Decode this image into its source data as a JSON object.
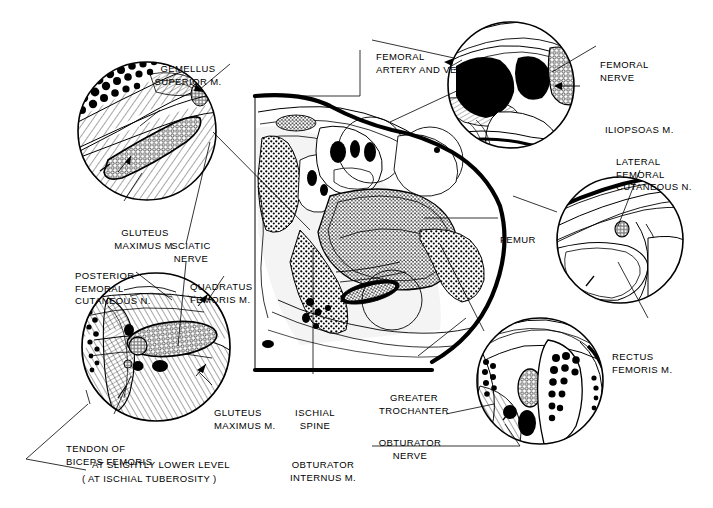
{
  "figure": {
    "domain_type": "anatomical-cross-section-illustration",
    "title_visible": false,
    "background_color": "#ffffff",
    "ink_color": "#000000",
    "caption": {
      "line1": "AT SLIGHTLY LOWER LEVEL",
      "line2": "( AT ISCHIAL TUBEROSITY )"
    }
  },
  "labels": [
    {
      "id": "gemellus-superior",
      "text": "GEMELLUS\nSUPERIOR M.",
      "x": 188,
      "y": 38,
      "align": "center"
    },
    {
      "id": "gluteus-maximus-upper",
      "text": "GLUTEUS\nMAXIMUS M.",
      "x": 100,
      "y": 202,
      "align": "center"
    },
    {
      "id": "sciatic-nerve",
      "text": "SCIATIC\nNERVE",
      "x": 185,
      "y": 215,
      "align": "center"
    },
    {
      "id": "posterior-femoral-cut",
      "text": "POSTERIOR\nFEMORAL\nCUTANEOUS N.",
      "x": 75,
      "y": 245,
      "align": "left"
    },
    {
      "id": "quadratus-femoris",
      "text": "QUADRATUS\nFEMORIS M.",
      "x": 190,
      "y": 256,
      "align": "left"
    },
    {
      "id": "gluteus-maximus-lower",
      "text": "GLUTEUS\nMAXIMUS M.",
      "x": 214,
      "y": 382,
      "align": "left"
    },
    {
      "id": "tendon-of-biceps-femoris",
      "text": "TENDON OF\nBICEPS FEMORIS",
      "x": 66,
      "y": 418,
      "align": "left"
    },
    {
      "id": "ischial-spine",
      "text": "ISCHIAL\nSPINE",
      "x": 313,
      "y": 382,
      "align": "center"
    },
    {
      "id": "obturator-internus",
      "text": "OBTURATOR\nINTERNUS M.",
      "x": 322,
      "y": 434,
      "align": "center"
    },
    {
      "id": "greater-trochanter",
      "text": "GREATER\nTROCHANTER",
      "x": 414,
      "y": 367,
      "align": "center"
    },
    {
      "id": "obturator-nerve",
      "text": "OBTURATOR\nNERVE",
      "x": 410,
      "y": 412,
      "align": "center"
    },
    {
      "id": "femoral-artery-and-vein",
      "text": "FEMORAL\nARTERY AND VEIN",
      "x": 376,
      "y": 26,
      "align": "left"
    },
    {
      "id": "femoral-nerve",
      "text": "FEMORAL\nNERVE",
      "x": 600,
      "y": 34,
      "align": "left"
    },
    {
      "id": "iliopsoas",
      "text": "ILIOPSOAS M.",
      "x": 605,
      "y": 99,
      "align": "left"
    },
    {
      "id": "lateral-femoral-cut",
      "text": "LATERAL\nFEMORAL\nCUTANEOUS N.",
      "x": 616,
      "y": 131,
      "align": "left"
    },
    {
      "id": "rectus-femoris",
      "text": "RECTUS\nFEMORIS M.",
      "x": 612,
      "y": 326,
      "align": "left"
    },
    {
      "id": "femur",
      "text": "FEMUR",
      "x": 500,
      "y": 214,
      "align": "left"
    },
    {
      "id": "caption-line1",
      "text": "AT SLIGHTLY LOWER LEVEL",
      "x": 92,
      "y": 463,
      "align": "left"
    },
    {
      "id": "caption-line2",
      "text": "( AT ISCHIAL TUBEROSITY )",
      "x": 82,
      "y": 477,
      "align": "left"
    }
  ],
  "insets": [
    {
      "id": "inset-gluteal-sciatic",
      "cx": 147,
      "cy": 131,
      "r": 69,
      "name": "gluteal region with sciatic nerve"
    },
    {
      "id": "inset-ischial-level",
      "cx": 156,
      "cy": 347,
      "r": 74,
      "name": "at ischial tuberosity level"
    },
    {
      "id": "inset-femoral-vessels",
      "cx": 511,
      "cy": 85,
      "r": 63,
      "name": "femoral artery vein and nerve"
    },
    {
      "id": "inset-lateral-cutaneous",
      "cx": 620,
      "cy": 240,
      "r": 63,
      "name": "lateral femoral cutaneous nerve"
    },
    {
      "id": "inset-obturator",
      "cx": 540,
      "cy": 381,
      "r": 63,
      "name": "obturator nerve region"
    }
  ],
  "main_section": {
    "id": "hip-cross-section",
    "name": "transverse section through hip joint",
    "structures": [
      "femur",
      "ischial spine",
      "obturator internus m.",
      "greater trochanter",
      "gluteus maximus m."
    ]
  }
}
